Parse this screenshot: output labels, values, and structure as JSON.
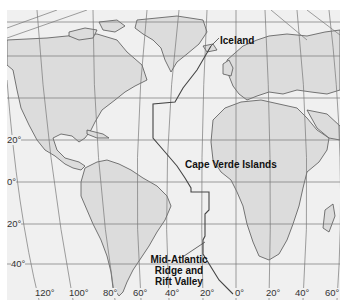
{
  "map": {
    "labels": {
      "iceland": "Iceland",
      "cape_verde": "Cape Verde Islands",
      "ridge_line1": "Mid-Atlantic",
      "ridge_line2": "Ridge and",
      "ridge_line3": "Rift Valley"
    },
    "latitude_ticks": [
      "20°",
      "0°",
      "20°",
      "40°"
    ],
    "longitude_ticks": [
      "120°",
      "100°",
      "80°",
      "60°",
      "40°",
      "20°",
      "0°",
      "20°",
      "40°",
      "60°"
    ],
    "colors": {
      "ocean": "#f0f0f0",
      "land": "#dcdcdc",
      "outline": "#555555",
      "grid": "#777777",
      "ridge": "#444444"
    }
  }
}
